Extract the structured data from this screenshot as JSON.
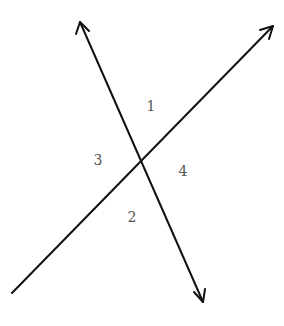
{
  "diagram": {
    "type": "intersecting-lines",
    "lines": [
      {
        "name": "line-a",
        "from": [
          80,
          22
        ],
        "to": [
          203,
          302
        ],
        "arrow_start": true,
        "arrow_end": true
      },
      {
        "name": "line-b",
        "from": [
          12,
          293
        ],
        "to": [
          273,
          26
        ],
        "arrow_start": false,
        "arrow_end": true
      }
    ],
    "intersection": [
      141,
      162
    ],
    "angle_labels": [
      {
        "text": "1",
        "x": 151,
        "y": 111
      },
      {
        "text": "3",
        "x": 98,
        "y": 165
      },
      {
        "text": "4",
        "x": 183,
        "y": 176
      },
      {
        "text": "2",
        "x": 132,
        "y": 222
      }
    ],
    "colors": {
      "line": "#111111",
      "label": "#555555",
      "background": "#ffffff"
    }
  }
}
